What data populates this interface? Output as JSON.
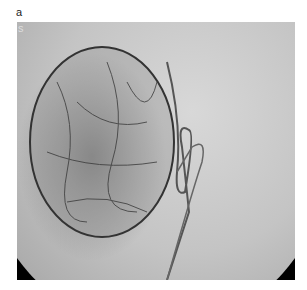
{
  "panel_label": "a",
  "inset_label": "s",
  "image": {
    "description": "Angiography fluoroscopic image showing hypervascular spherical mass with catheter loop",
    "tone": "grayscale"
  }
}
